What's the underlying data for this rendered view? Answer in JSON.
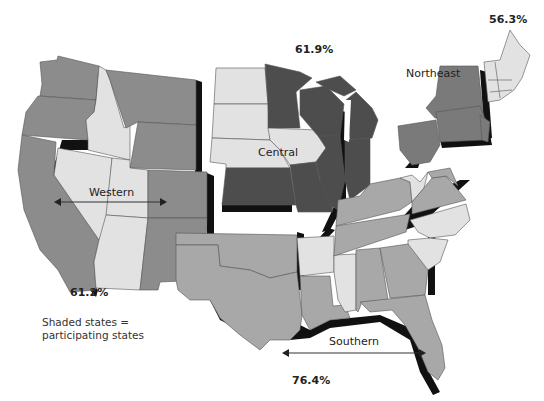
{
  "map": {
    "title": "",
    "colors": {
      "western": "#8c8c8c",
      "central": "#4d4d4d",
      "northeast": "#7a7a7a",
      "southern": "#a8a8a8",
      "nonparticipating": "#e2e2e2",
      "shadow": "#111111"
    },
    "regions": [
      {
        "id": "western",
        "label": "Western",
        "percent": "61.2%"
      },
      {
        "id": "central",
        "label": "Central",
        "percent": "61.9%"
      },
      {
        "id": "northeast",
        "label": "Northeast",
        "percent": "56.3%"
      },
      {
        "id": "southern",
        "label": "Southern",
        "percent": "76.4%"
      }
    ],
    "legend": {
      "line1": "Shaded states =",
      "line2": "participating states"
    }
  }
}
